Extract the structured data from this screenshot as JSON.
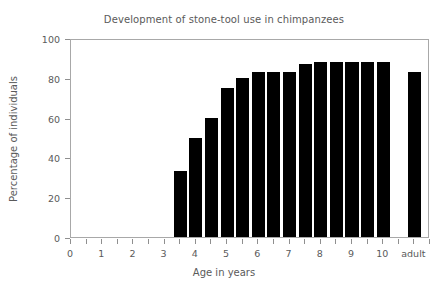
{
  "chart_data": {
    "type": "bar",
    "title": "Development of stone-tool use in chimpanzees",
    "xlabel": "Age in years",
    "ylabel": "Percentage of individuals",
    "categories": [
      "3.5",
      "4.0",
      "4.5",
      "5.0",
      "5.5",
      "6.0",
      "6.5",
      "7.0",
      "7.5",
      "8.0",
      "8.5",
      "9.0",
      "9.5",
      "10.0",
      "adult"
    ],
    "values": [
      33,
      50,
      60,
      75,
      80,
      83,
      83,
      83,
      87,
      88,
      88,
      88,
      88,
      88,
      83
    ],
    "ylim": [
      0,
      100
    ],
    "xlim": [
      0,
      11.5
    ],
    "x_positions": [
      3.5,
      4.0,
      4.5,
      5.0,
      5.5,
      6.0,
      6.5,
      7.0,
      7.5,
      8.0,
      8.5,
      9.0,
      9.5,
      10.0,
      11.0
    ],
    "bar_width": 0.42,
    "grid": false,
    "legend": null,
    "bar_color": "#000000",
    "frame_color": "#a8a8a8",
    "text_color": "#5a5a5a",
    "background": "#ffffff",
    "y_ticks": [
      0,
      20,
      40,
      60,
      80,
      100
    ],
    "y_tick_labels": [
      "0",
      "20",
      "40",
      "60",
      "80",
      "100"
    ],
    "x_ticks": [
      0,
      0.5,
      1,
      1.5,
      2,
      2.5,
      3,
      3.5,
      4,
      4.5,
      5,
      5.5,
      6,
      6.5,
      7,
      7.5,
      8,
      8.5,
      9,
      9.5,
      10,
      10.5,
      11,
      11.5
    ],
    "x_major_ticks": [
      0,
      1,
      2,
      3,
      4,
      5,
      6,
      7,
      8,
      9,
      10,
      11
    ],
    "x_major_tick_labels": [
      "0",
      "1",
      "2",
      "3",
      "4",
      "5",
      "6",
      "7",
      "8",
      "9",
      "10",
      "adult"
    ]
  }
}
